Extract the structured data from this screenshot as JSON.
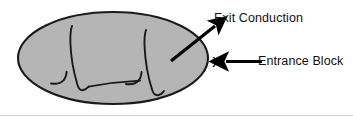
{
  "figure": {
    "type": "annotated-medical-diagram",
    "background_color": "#ffffff",
    "ellipse": {
      "name": "myocardial-focus-ellipse",
      "fill_color": "#b5b5b5",
      "stroke_color": "#1a1a1a",
      "center_x": 113,
      "center_y": 58,
      "radius_x": 96,
      "radius_y": 47
    },
    "waveforms": {
      "stroke_color": "#1a1a1a",
      "description": "two hand-drawn QRS-like electrogram deflections inside the ellipse"
    },
    "labels": [
      {
        "id": "exit-conduction",
        "text": "Exit Conduction",
        "arrow": "diagonal-up-right",
        "arrow_from": [
          172,
          60
        ],
        "arrow_to": [
          216,
          25
        ]
      },
      {
        "id": "entrance-block",
        "text": "Entrance Block",
        "arrow": "horizontal-left",
        "arrow_from": [
          262,
          62
        ],
        "arrow_to": [
          225,
          62
        ]
      }
    ],
    "marker": {
      "id": "block-site-marker",
      "text": "X",
      "x": 212,
      "y": 54
    }
  }
}
